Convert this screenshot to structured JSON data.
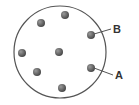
{
  "diagram": {
    "circle": {
      "cx": 60,
      "cy": 52,
      "r": 46,
      "stroke": "#555555",
      "fill": "#ffffff"
    },
    "dot_color": "#5a5a5a",
    "dot_highlight": "#8a8a8a",
    "dots": [
      {
        "cx": 41,
        "cy": 23
      },
      {
        "cx": 65,
        "cy": 15
      },
      {
        "cx": 91,
        "cy": 35
      },
      {
        "cx": 22,
        "cy": 53
      },
      {
        "cx": 59,
        "cy": 52
      },
      {
        "cx": 37,
        "cy": 72
      },
      {
        "cx": 91,
        "cy": 68
      },
      {
        "cx": 62,
        "cy": 88
      }
    ],
    "labels": [
      {
        "text": "B",
        "x": 113,
        "y": 33,
        "line": [
          94,
          34,
          111,
          29
        ]
      },
      {
        "text": "A",
        "x": 115,
        "y": 79,
        "line": [
          94,
          68,
          113,
          75
        ]
      }
    ]
  }
}
